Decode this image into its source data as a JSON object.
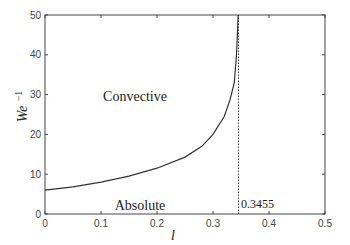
{
  "chart_data": {
    "type": "line",
    "title": "",
    "xlabel": "l",
    "ylabel": "We^-1",
    "ylabel_base": "We",
    "ylabel_sup": "−1",
    "xlim": [
      0,
      0.5
    ],
    "ylim": [
      0,
      50
    ],
    "grid": false,
    "legend": null,
    "x_ticks": [
      "0",
      "0.1",
      "0.2",
      "0.3",
      "0.4",
      "0.5"
    ],
    "y_ticks": [
      "0",
      "10",
      "20",
      "30",
      "40",
      "50"
    ],
    "series": [
      {
        "name": "boundary",
        "style": "solid",
        "x": [
          0.0,
          0.05,
          0.1,
          0.15,
          0.2,
          0.25,
          0.28,
          0.3,
          0.32,
          0.33,
          0.338,
          0.342,
          0.345
        ],
        "y": [
          6.0,
          6.8,
          8.0,
          9.5,
          11.5,
          14.3,
          17.0,
          20.0,
          24.5,
          28.5,
          33.0,
          40.0,
          50.0
        ]
      },
      {
        "name": "asymptote",
        "style": "dotted",
        "x": [
          0.3455,
          0.3455
        ],
        "y": [
          0,
          50
        ]
      }
    ],
    "annotations": [
      {
        "text": "Convective",
        "x": 0.17,
        "y": 30
      },
      {
        "text": "Absolute",
        "x": 0.17,
        "y": 2
      },
      {
        "text": "0.3455",
        "x": 0.35,
        "y": 3
      }
    ]
  },
  "labels": {
    "convective": "Convective",
    "absolute": "Absolute",
    "critical_value": "0.3455",
    "xlabel": "l",
    "ylabel_base": "We",
    "ylabel_sup": "−1"
  }
}
